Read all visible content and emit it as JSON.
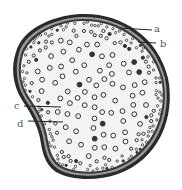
{
  "diagram": {
    "type": "cross-section",
    "colors": {
      "background": "#ffffff",
      "outline": "#2a2a2a",
      "band": "#9a9a9a",
      "interior": "#f3f3f3",
      "bundle": "#333333"
    },
    "labels": [
      {
        "id": "a",
        "text": "a",
        "x": 154,
        "y": 32,
        "line": [
          120,
          28,
          152,
          30
        ]
      },
      {
        "id": "b",
        "text": "b",
        "x": 160,
        "y": 47,
        "line": [
          138,
          42,
          156,
          43
        ]
      },
      {
        "id": "c",
        "text": "c",
        "x": 14,
        "y": 109,
        "line": [
          24,
          106,
          61,
          107
        ]
      },
      {
        "id": "d",
        "text": "d",
        "x": 17,
        "y": 127,
        "line": [
          28,
          121,
          63,
          122
        ]
      }
    ]
  }
}
